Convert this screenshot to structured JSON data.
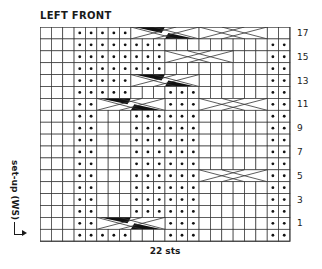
{
  "title": "LEFT FRONT",
  "side_label": "set-up (WS)",
  "footer_label": "22 sts",
  "grid": {
    "columns": 22,
    "rows_count": 18,
    "cell_w": 11.36,
    "cell_h": 11.9,
    "line_color": "#333333",
    "dot_color": "#111111",
    "cable_fill": "#111111"
  },
  "row_labels": [
    {
      "row_index": 0,
      "label": "17"
    },
    {
      "row_index": 2,
      "label": "15"
    },
    {
      "row_index": 4,
      "label": "13"
    },
    {
      "row_index": 6,
      "label": "11"
    },
    {
      "row_index": 8,
      "label": "9"
    },
    {
      "row_index": 10,
      "label": "7"
    },
    {
      "row_index": 12,
      "label": "5"
    },
    {
      "row_index": 14,
      "label": "3"
    },
    {
      "row_index": 16,
      "label": "1"
    }
  ],
  "chart_data": {
    "type": "table",
    "title": "LEFT FRONT",
    "xlabel": "22 sts",
    "ylabel": "set-up (WS)",
    "legend": {
      "dot": "purl on RS",
      "empty": "knit on RS",
      "cable": "6-st cable cross"
    },
    "rows": [
      {
        "name": "17",
        "cells": "...ooooo..............oo",
        "cables": [
          {
            "start": 9,
            "width": 6,
            "style": "dark"
          },
          {
            "start": 15,
            "width": 6,
            "style": "light"
          }
        ]
      },
      {
        "name": "16",
        "cells": "...oooooooo.........oo",
        "cables": []
      },
      {
        "name": "15",
        "cells": "...oooooooo.........oo",
        "cables": [
          {
            "start": 12,
            "width": 6,
            "style": "light"
          }
        ]
      },
      {
        "name": "14",
        "cells": "...oooooooo.........oo",
        "cables": []
      },
      {
        "name": "13",
        "cells": "...ooooo............oo",
        "cables": [
          {
            "start": 9,
            "width": 6,
            "style": "dark"
          }
        ]
      },
      {
        "name": "12",
        "cells": "...ooooo...ooo......oo",
        "cables": []
      },
      {
        "name": "11",
        "cells": "...oo......ooo......oo",
        "cables": [
          {
            "start": 6,
            "width": 6,
            "style": "dark"
          },
          {
            "start": 15,
            "width": 6,
            "style": "light"
          }
        ]
      },
      {
        "name": "10",
        "cells": "...oo...oooooo......oo",
        "cables": []
      },
      {
        "name": "9",
        "cells": "...oo...oooooo......oo",
        "cables": []
      },
      {
        "name": "8",
        "cells": "...oo...oooooo......oo",
        "cables": []
      },
      {
        "name": "7",
        "cells": "...oo...oooooo......oo",
        "cables": []
      },
      {
        "name": "6",
        "cells": "...oo...oooooo......oo",
        "cables": []
      },
      {
        "name": "5",
        "cells": "...oo...oooooo......oo",
        "cables": [
          {
            "start": 15,
            "width": 6,
            "style": "light"
          }
        ]
      },
      {
        "name": "4",
        "cells": "...oo...oooooo......oo",
        "cables": []
      },
      {
        "name": "3",
        "cells": "...oo...oooooo......oo",
        "cables": []
      },
      {
        "name": "2",
        "cells": "...oo...oooooo......oo",
        "cables": []
      },
      {
        "name": "1",
        "cells": "...oo......ooo......oo",
        "cables": [
          {
            "start": 6,
            "width": 6,
            "style": "dark"
          }
        ]
      },
      {
        "name": "set-up",
        "cells": "...ooooo...ooo......oo",
        "cables": []
      }
    ]
  }
}
